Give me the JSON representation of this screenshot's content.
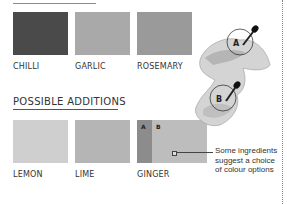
{
  "top_swatches": [
    {
      "label": "CHILLI",
      "color": "#4a4a4a"
    },
    {
      "label": "GARLIC",
      "color": "#a9a9a9"
    },
    {
      "label": "ROSEMARY",
      "color": "#9a9a9a"
    }
  ],
  "section": {
    "heading": "POSSIBLE ADDITIONS"
  },
  "bottom_swatches": [
    {
      "label": "LEMON",
      "color": "#cfcfcf"
    },
    {
      "label": "LIME",
      "color": "#b5b5b5"
    },
    {
      "label": "GINGER",
      "segments": [
        {
          "letter": "A",
          "color": "#8c8c8c"
        },
        {
          "letter": "B",
          "color": "#bdbdbd"
        }
      ]
    }
  ],
  "illustration": {
    "markers": [
      "A",
      "B"
    ],
    "icon": "eyedropper-icon"
  },
  "annotation": {
    "lines": [
      "Some ingredients",
      "suggest a choice",
      "of colour options"
    ]
  }
}
